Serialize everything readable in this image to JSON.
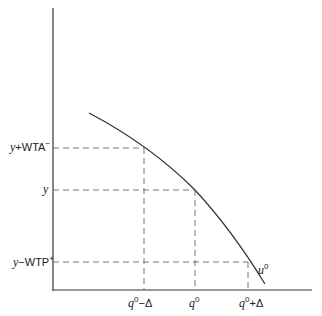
{
  "diagram": {
    "curve_label": {
      "base": "u",
      "sup": "0"
    },
    "y_labels": [
      {
        "pre": "y",
        "op": "+",
        "main": "WTA",
        "sup": "−"
      },
      {
        "pre": "y",
        "op": "",
        "main": "",
        "sup": ""
      },
      {
        "pre": "y",
        "op": "−",
        "main": "WTP",
        "sup": "+"
      }
    ],
    "x_labels": [
      {
        "base": "q",
        "sup": "0",
        "suffix": "−Δ"
      },
      {
        "base": "q",
        "sup": "0",
        "suffix": ""
      },
      {
        "base": "q",
        "sup": "0",
        "suffix": "+Δ"
      }
    ],
    "colors": {
      "line": "#333333",
      "dash": "#666666"
    }
  }
}
